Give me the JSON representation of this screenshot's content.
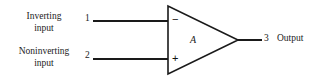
{
  "diagram": {
    "background_color": "#ffffff",
    "line_color": "#1a1a1a",
    "labels": {
      "inverting_input_line1": "Inverting",
      "inverting_input_line2": "input",
      "noninverting_input_line1": "Noninverting",
      "noninverting_input_line2": "input",
      "output": "Output"
    },
    "pins": {
      "inverting": "1",
      "noninverting": "2",
      "output": "3"
    },
    "symbols": {
      "inverting_sign": "−",
      "noninverting_sign": "+",
      "gain": "A"
    }
  }
}
